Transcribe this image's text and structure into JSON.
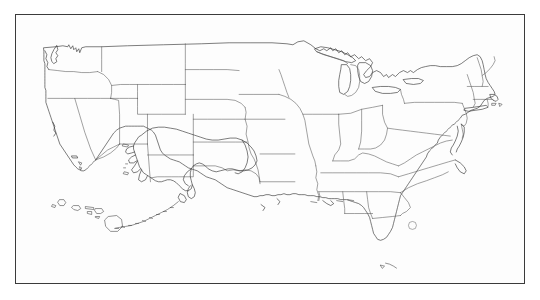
{
  "document": {
    "title": "United States Outline Map",
    "type": "blank-political-outline-map",
    "description": "Black-and-white line-art outline map of the United States showing all state boundaries, with Alaska and Hawaii inset at lower left, enclosed in a thin rectangular frame.",
    "has_labels": false,
    "has_legend": false,
    "has_title_text": false,
    "has_scale_bar": false,
    "has_compass": false,
    "visible_text": ""
  },
  "canvas": {
    "width": 540,
    "height": 300,
    "background_color": "#ffffff"
  },
  "frame": {
    "x": 15,
    "y": 14,
    "width": 510,
    "height": 270,
    "border_color": "#3b3b3b",
    "border_width_px": 1.5,
    "fill_color": "#fdfdfd"
  },
  "styles": {
    "coastline_color": "#2e2e2e",
    "state_border_color": "#555555",
    "island_color": "#3a3a3a",
    "lake_color": "#5a5a5a",
    "land_fill": "none"
  },
  "map_content": {
    "projection_note": "conic-like continental United States",
    "regions": [
      {
        "name": "contiguous-united-states",
        "placement": "main body, upper two-thirds of frame"
      },
      {
        "name": "alaska",
        "placement": "lower-left-center inset"
      },
      {
        "name": "hawaii",
        "placement": "lower-left inset, island chain"
      }
    ],
    "water_features": [
      "Great Lakes",
      "Chesapeake Bay",
      "Lake Okeechobee",
      "Puget Sound",
      "San Francisco Bay",
      "Gulf of Mexico coastline",
      "Cook Inlet"
    ],
    "notable_shapes": [
      "Florida peninsula and Keys",
      "Texas panhandle",
      "Michigan upper and lower peninsulas",
      "Cape Cod",
      "Long Island",
      "Delmarva Peninsula",
      "Outer Banks",
      "Aleutian Islands chain",
      "Baja-facing California coast"
    ]
  },
  "states": [
    {
      "code": "WA",
      "name": "Washington"
    },
    {
      "code": "OR",
      "name": "Oregon"
    },
    {
      "code": "CA",
      "name": "California"
    },
    {
      "code": "NV",
      "name": "Nevada"
    },
    {
      "code": "ID",
      "name": "Idaho"
    },
    {
      "code": "MT",
      "name": "Montana"
    },
    {
      "code": "WY",
      "name": "Wyoming"
    },
    {
      "code": "UT",
      "name": "Utah"
    },
    {
      "code": "AZ",
      "name": "Arizona"
    },
    {
      "code": "NM",
      "name": "New Mexico"
    },
    {
      "code": "CO",
      "name": "Colorado"
    },
    {
      "code": "ND",
      "name": "North Dakota"
    },
    {
      "code": "SD",
      "name": "South Dakota"
    },
    {
      "code": "NE",
      "name": "Nebraska"
    },
    {
      "code": "KS",
      "name": "Kansas"
    },
    {
      "code": "OK",
      "name": "Oklahoma"
    },
    {
      "code": "TX",
      "name": "Texas"
    },
    {
      "code": "MN",
      "name": "Minnesota"
    },
    {
      "code": "IA",
      "name": "Iowa"
    },
    {
      "code": "MO",
      "name": "Missouri"
    },
    {
      "code": "AR",
      "name": "Arkansas"
    },
    {
      "code": "LA",
      "name": "Louisiana"
    },
    {
      "code": "WI",
      "name": "Wisconsin"
    },
    {
      "code": "IL",
      "name": "Illinois"
    },
    {
      "code": "MI",
      "name": "Michigan"
    },
    {
      "code": "IN",
      "name": "Indiana"
    },
    {
      "code": "OH",
      "name": "Ohio"
    },
    {
      "code": "KY",
      "name": "Kentucky"
    },
    {
      "code": "TN",
      "name": "Tennessee"
    },
    {
      "code": "MS",
      "name": "Mississippi"
    },
    {
      "code": "AL",
      "name": "Alabama"
    },
    {
      "code": "GA",
      "name": "Georgia"
    },
    {
      "code": "FL",
      "name": "Florida"
    },
    {
      "code": "SC",
      "name": "South Carolina"
    },
    {
      "code": "NC",
      "name": "North Carolina"
    },
    {
      "code": "VA",
      "name": "Virginia"
    },
    {
      "code": "WV",
      "name": "West Virginia"
    },
    {
      "code": "MD",
      "name": "Maryland"
    },
    {
      "code": "DE",
      "name": "Delaware"
    },
    {
      "code": "PA",
      "name": "Pennsylvania"
    },
    {
      "code": "NJ",
      "name": "New Jersey"
    },
    {
      "code": "NY",
      "name": "New York"
    },
    {
      "code": "CT",
      "name": "Connecticut"
    },
    {
      "code": "RI",
      "name": "Rhode Island"
    },
    {
      "code": "MA",
      "name": "Massachusetts"
    },
    {
      "code": "VT",
      "name": "Vermont"
    },
    {
      "code": "NH",
      "name": "New Hampshire"
    },
    {
      "code": "ME",
      "name": "Maine"
    },
    {
      "code": "AK",
      "name": "Alaska"
    },
    {
      "code": "HI",
      "name": "Hawaii"
    }
  ]
}
